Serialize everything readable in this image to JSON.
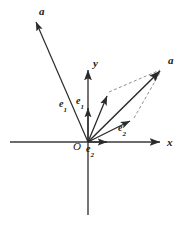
{
  "figure": {
    "background_color": "#ffffff",
    "stroke_color": "#2b2b2b",
    "dashed_color": "#9a9a9a",
    "width": 180,
    "height": 227
  },
  "axes": {
    "x_label": "x",
    "y_label": "y",
    "origin_label": "O",
    "origin": {
      "x": 88,
      "y": 142
    },
    "x_start": {
      "x": 10,
      "y": 142
    },
    "x_end": {
      "x": 166,
      "y": 142
    },
    "y_top": {
      "x": 88,
      "y": 66
    },
    "y_bottom": {
      "x": 88,
      "y": 215
    }
  },
  "labels": {
    "vector_a_left": "a",
    "vector_a_right": "a",
    "e1_left": "e",
    "e1_left_sub": "1",
    "e1_right": "e",
    "e1_right_sub": "1",
    "e2_bottom": "e",
    "e2_bottom_sub": "2",
    "e2_slant": "e",
    "e2_slant_sub": "2"
  },
  "vectors": [
    {
      "name": "a-upper-left",
      "label": "a",
      "from": {
        "x": 88,
        "y": 142
      },
      "to": {
        "x": 34,
        "y": 18
      },
      "style": "solid",
      "arrow": true
    },
    {
      "name": "a-upper-right",
      "label": "a",
      "from": {
        "x": 88,
        "y": 142
      },
      "to": {
        "x": 162,
        "y": 69
      },
      "style": "solid",
      "arrow": true
    },
    {
      "name": "e1-vertical",
      "label": "e1",
      "from": {
        "x": 88,
        "y": 142
      },
      "to": {
        "x": 88,
        "y": 104
      },
      "style": "solid",
      "arrow": true
    },
    {
      "name": "e1-slant",
      "label": "e1",
      "from": {
        "x": 88,
        "y": 142
      },
      "to": {
        "x": 109,
        "y": 92
      },
      "style": "solid",
      "arrow": true
    },
    {
      "name": "e2-horizontal",
      "label": "e2",
      "from": {
        "x": 88,
        "y": 142
      },
      "to": {
        "x": 111,
        "y": 142
      },
      "style": "solid",
      "arrow": true
    },
    {
      "name": "e2-slant",
      "label": "e2",
      "from": {
        "x": 88,
        "y": 142
      },
      "to": {
        "x": 134,
        "y": 118
      },
      "style": "solid",
      "arrow": true
    }
  ],
  "parallelogram": {
    "vertices": [
      {
        "x": 88,
        "y": 142
      },
      {
        "x": 109,
        "y": 92
      },
      {
        "x": 162,
        "y": 69
      },
      {
        "x": 134,
        "y": 118
      }
    ],
    "dashed_edges": [
      {
        "from": {
          "x": 109,
          "y": 92
        },
        "to": {
          "x": 162,
          "y": 69
        }
      },
      {
        "from": {
          "x": 134,
          "y": 118
        },
        "to": {
          "x": 162,
          "y": 69
        }
      }
    ]
  }
}
